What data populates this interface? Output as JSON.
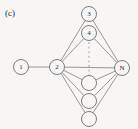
{
  "figure": {
    "panel_label": "(c)",
    "background_color": "#f7f6f4",
    "stroke_color": "#8d8d8d",
    "node_stroke_color": "#6f6f6f",
    "label_color": "#2b2b2b",
    "width": 138,
    "height": 129
  },
  "chart_data": {
    "type": "diagram",
    "subtype": "node-link-graph",
    "title": "(c)",
    "nodes": [
      {
        "id": "n1",
        "label": "1",
        "x": 21,
        "y": 67,
        "r": 7.5,
        "labeled": true
      },
      {
        "id": "n2",
        "label": "2",
        "x": 57,
        "y": 67,
        "r": 7.5,
        "labeled": true
      },
      {
        "id": "n3",
        "label": "3",
        "x": 89,
        "y": 14,
        "r": 7.5,
        "labeled": true
      },
      {
        "id": "n4",
        "label": "4",
        "x": 89,
        "y": 33,
        "r": 7.5,
        "labeled": true
      },
      {
        "id": "nN",
        "label": "N",
        "x": 122,
        "y": 68,
        "r": 7.5,
        "labeled": true
      },
      {
        "id": "e1",
        "label": "",
        "x": 89,
        "y": 83,
        "r": 7.5,
        "labeled": false
      },
      {
        "id": "e2",
        "label": "",
        "x": 89,
        "y": 101,
        "r": 7.5,
        "labeled": false
      },
      {
        "id": "e3",
        "label": "",
        "x": 89,
        "y": 119,
        "r": 7.5,
        "labeled": false
      }
    ],
    "edges": [
      {
        "from": "n1",
        "to": "n2",
        "style": "solid"
      },
      {
        "from": "n2",
        "to": "n3",
        "style": "solid"
      },
      {
        "from": "n2",
        "to": "n4",
        "style": "solid"
      },
      {
        "from": "n2",
        "to": "nN",
        "style": "solid"
      },
      {
        "from": "n2",
        "to": "e1",
        "style": "solid"
      },
      {
        "from": "n2",
        "to": "e2",
        "style": "solid"
      },
      {
        "from": "n2",
        "to": "e3",
        "style": "solid"
      },
      {
        "from": "n3",
        "to": "nN",
        "style": "solid"
      },
      {
        "from": "n4",
        "to": "nN",
        "style": "solid"
      },
      {
        "from": "e1",
        "to": "nN",
        "style": "solid"
      },
      {
        "from": "e2",
        "to": "nN",
        "style": "solid"
      },
      {
        "from": "e3",
        "to": "nN",
        "style": "solid"
      }
    ],
    "ellipsis": {
      "style": "dashed-vertical",
      "x": 89,
      "y_start": 42,
      "y_end": 75
    },
    "xlabel": "",
    "ylabel": "",
    "legend": []
  }
}
